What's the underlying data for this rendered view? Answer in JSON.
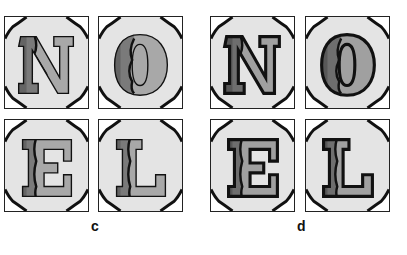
{
  "figure": {
    "panels": [
      {
        "label": "c",
        "style": "thin-outline",
        "tiles": [
          {
            "letter": "N",
            "dark": "#555555",
            "mid": "#7a7a7a",
            "light": "#a8a8a8"
          },
          {
            "letter": "O",
            "dark": "#555555",
            "mid": "#7a7a7a",
            "light": "#a8a8a8"
          },
          {
            "letter": "E",
            "dark": "#555555",
            "mid": "#7a7a7a",
            "light": "#a8a8a8"
          },
          {
            "letter": "L",
            "dark": "#555555",
            "mid": "#7a7a7a",
            "light": "#a8a8a8"
          }
        ]
      },
      {
        "label": "d",
        "style": "thick-outline",
        "tiles": [
          {
            "letter": "N",
            "dark": "#4a4a4a",
            "mid": "#6e6e6e",
            "light": "#a0a0a0"
          },
          {
            "letter": "O",
            "dark": "#4a4a4a",
            "mid": "#6e6e6e",
            "light": "#a0a0a0"
          },
          {
            "letter": "E",
            "dark": "#4a4a4a",
            "mid": "#6e6e6e",
            "light": "#a0a0a0"
          },
          {
            "letter": "L",
            "dark": "#4a4a4a",
            "mid": "#6e6e6e",
            "light": "#a0a0a0"
          }
        ]
      }
    ],
    "colors": {
      "tile_bg": "#e4e4e4",
      "corner_bg": "#ffffff",
      "outline": "#111111"
    }
  }
}
